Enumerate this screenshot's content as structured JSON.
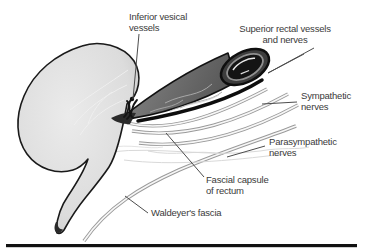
{
  "figure": {
    "type": "anatomical-diagram",
    "labels": {
      "inferior_vesical_vessels": {
        "line1": "Inferior vesical",
        "line2": "vessels"
      },
      "superior_rectal_vessels": {
        "line1": "Superior rectal vessels",
        "line2": "and nerves"
      },
      "sympathetic_nerves": {
        "line1": "Sympathetic",
        "line2": "nerves"
      },
      "parasympathetic_nerves": {
        "line1": "Parasympathetic",
        "line2": "nerves"
      },
      "fascial_capsule": {
        "line1": "Fascial capsule",
        "line2": "of rectum"
      },
      "waldeyers_fascia": {
        "line1": "Waldeyer's fascia"
      }
    },
    "colors": {
      "background": "#ffffff",
      "text": "#3a3a3a",
      "outline_black": "#1a1a1a",
      "bladder_fill": "#d9d9d9",
      "rectum_fill_dark": "#5f5f5f",
      "rectum_fill_light": "#8a8a8a",
      "fascia_band_gray": "#9a9a9a",
      "plexus_faint_gray": "#d9d9d9",
      "bottom_rule": "#111111"
    }
  }
}
